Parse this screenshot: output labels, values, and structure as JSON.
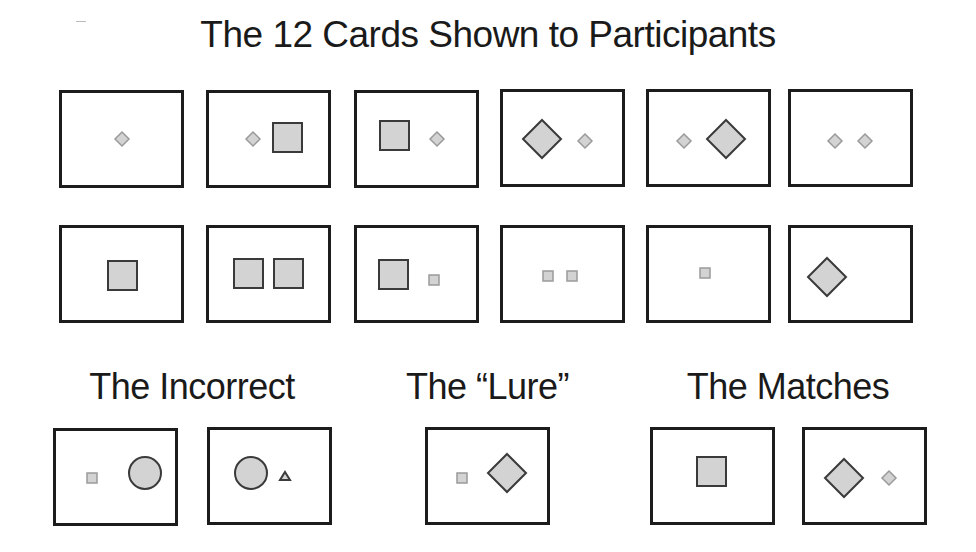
{
  "title": "The 12 Cards Shown to Participants",
  "colors": {
    "card_border": "#1c1c1c",
    "shape_fill": "#d3d3d3",
    "large_shape_stroke": "#3a3a3a",
    "small_shape_stroke": "#9a9a9a"
  },
  "shown_cards": [
    {
      "id": 1,
      "shapes": [
        {
          "type": "diamond",
          "size": "small"
        }
      ]
    },
    {
      "id": 2,
      "shapes": [
        {
          "type": "diamond",
          "size": "small"
        },
        {
          "type": "square",
          "size": "large"
        }
      ]
    },
    {
      "id": 3,
      "shapes": [
        {
          "type": "square",
          "size": "large"
        },
        {
          "type": "diamond",
          "size": "small"
        }
      ]
    },
    {
      "id": 4,
      "shapes": [
        {
          "type": "diamond",
          "size": "large"
        },
        {
          "type": "diamond",
          "size": "small"
        }
      ]
    },
    {
      "id": 5,
      "shapes": [
        {
          "type": "diamond",
          "size": "small"
        },
        {
          "type": "diamond",
          "size": "large"
        }
      ]
    },
    {
      "id": 6,
      "shapes": [
        {
          "type": "diamond",
          "size": "small"
        },
        {
          "type": "diamond",
          "size": "small"
        }
      ]
    },
    {
      "id": 7,
      "shapes": [
        {
          "type": "square",
          "size": "large"
        }
      ]
    },
    {
      "id": 8,
      "shapes": [
        {
          "type": "square",
          "size": "large"
        },
        {
          "type": "square",
          "size": "large"
        }
      ]
    },
    {
      "id": 9,
      "shapes": [
        {
          "type": "square",
          "size": "large"
        },
        {
          "type": "square",
          "size": "small"
        }
      ]
    },
    {
      "id": 10,
      "shapes": [
        {
          "type": "square",
          "size": "small"
        },
        {
          "type": "square",
          "size": "small"
        }
      ]
    },
    {
      "id": 11,
      "shapes": [
        {
          "type": "square",
          "size": "small"
        }
      ]
    },
    {
      "id": 12,
      "shapes": [
        {
          "type": "diamond",
          "size": "large"
        }
      ]
    }
  ],
  "sections": {
    "incorrect": {
      "label": "The Incorrect",
      "cards": [
        {
          "shapes": [
            {
              "type": "square",
              "size": "small"
            },
            {
              "type": "circle",
              "size": "large"
            }
          ]
        },
        {
          "shapes": [
            {
              "type": "circle",
              "size": "large"
            },
            {
              "type": "triangle",
              "size": "small"
            }
          ]
        }
      ]
    },
    "lure": {
      "label": "The “Lure”",
      "cards": [
        {
          "shapes": [
            {
              "type": "square",
              "size": "small"
            },
            {
              "type": "diamond",
              "size": "large"
            }
          ]
        }
      ]
    },
    "matches": {
      "label": "The Matches",
      "cards": [
        {
          "shapes": [
            {
              "type": "square",
              "size": "large"
            }
          ]
        },
        {
          "shapes": [
            {
              "type": "diamond",
              "size": "large"
            },
            {
              "type": "diamond",
              "size": "small"
            }
          ]
        }
      ]
    }
  }
}
